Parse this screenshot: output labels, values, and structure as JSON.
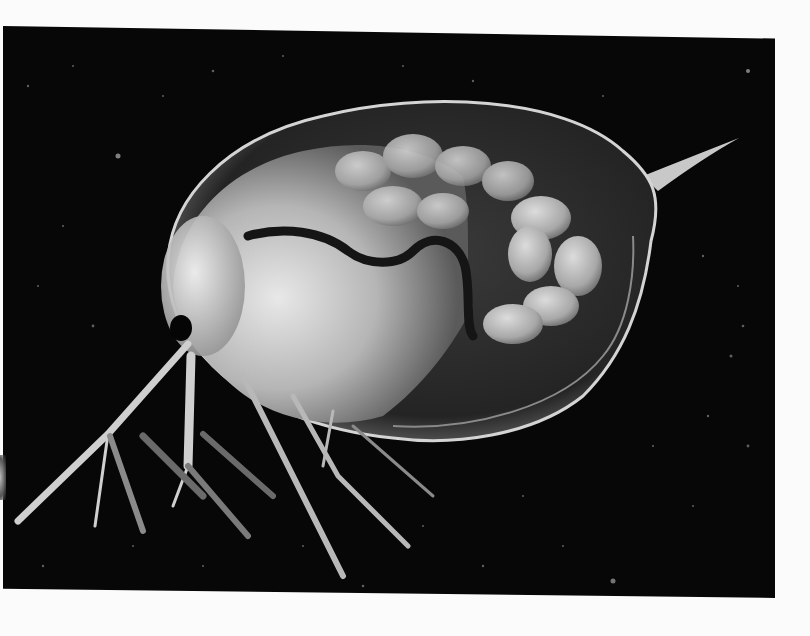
{
  "image": {
    "subject": "water flea (Daphnia) photomicrograph",
    "style": "black-and-white darkfield micrograph",
    "background_color": "#070707",
    "page_color": "#fbfbfb",
    "specimen_tones": {
      "carapace_edge": "#cfcfcf",
      "carapace_fill": "#2a2a2a",
      "body_highlight": "#e6e6e6",
      "body_mid": "#9a9a9a",
      "eggs": "#bdbdbd",
      "gut": "#1a1a1a",
      "eye": "#050505"
    }
  }
}
